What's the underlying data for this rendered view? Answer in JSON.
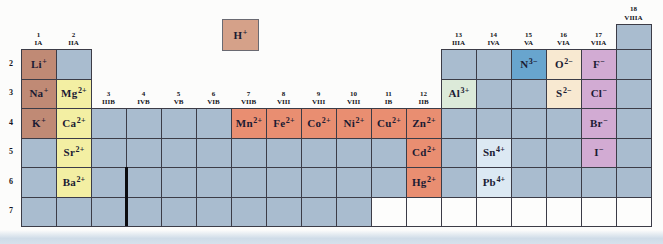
{
  "palette": {
    "grid_line": "#3c3c47",
    "cell_empty": "#a9bccf",
    "cell_white": "#fdfdfc",
    "hydrogen": "#d5a189",
    "alkali": "#c08a75",
    "alkaline_earth": "#f3efa3",
    "transition": "#e98e71",
    "post_transition_green": "#dcead9",
    "post_transition_blue": "#dce9f3",
    "nitride_blue": "#68a5ce",
    "chalcogenide_cream": "#f8e9d1",
    "halide_pink": "#d2abd3",
    "ion_text": "#1b1b33",
    "header_text": "#131320"
  },
  "columns": [
    {
      "number": "1",
      "roman": "IA",
      "first_row": 2
    },
    {
      "number": "2",
      "roman": "IIA",
      "first_row": 2
    },
    {
      "number": "3",
      "roman": "IIIB",
      "first_row": 4
    },
    {
      "number": "4",
      "roman": "IVB",
      "first_row": 4
    },
    {
      "number": "5",
      "roman": "VB",
      "first_row": 4
    },
    {
      "number": "6",
      "roman": "VIB",
      "first_row": 4
    },
    {
      "number": "7",
      "roman": "VIIB",
      "first_row": 4
    },
    {
      "number": "8",
      "roman": "VIII",
      "first_row": 4
    },
    {
      "number": "9",
      "roman": "VIII",
      "first_row": 4
    },
    {
      "number": "10",
      "roman": "VIII",
      "first_row": 4
    },
    {
      "number": "11",
      "roman": "IB",
      "first_row": 4
    },
    {
      "number": "12",
      "roman": "IIB",
      "first_row": 4
    },
    {
      "number": "13",
      "roman": "IIIA",
      "first_row": 2
    },
    {
      "number": "14",
      "roman": "IVA",
      "first_row": 2
    },
    {
      "number": "15",
      "roman": "VA",
      "first_row": 2
    },
    {
      "number": "16",
      "roman": "VIA",
      "first_row": 2
    },
    {
      "number": "17",
      "roman": "VIIA",
      "first_row": 2
    },
    {
      "number": "18",
      "roman": "VIIIA",
      "first_row": 1
    }
  ],
  "period_labels": [
    "2",
    "3",
    "4",
    "5",
    "6",
    "7"
  ],
  "row7_white_start_col": 11,
  "hydrogen_cell": {
    "symbol": "H",
    "charge": "+"
  },
  "ions": [
    {
      "col": 1,
      "row": 2,
      "symbol": "Li",
      "charge": "+",
      "category": "alkali"
    },
    {
      "col": 1,
      "row": 3,
      "symbol": "Na",
      "charge": "+",
      "category": "alkali"
    },
    {
      "col": 1,
      "row": 4,
      "symbol": "K",
      "charge": "+",
      "category": "alkali"
    },
    {
      "col": 2,
      "row": 3,
      "symbol": "Mg",
      "charge": "2+",
      "category": "alkaline_earth"
    },
    {
      "col": 2,
      "row": 4,
      "symbol": "Ca",
      "charge": "2+",
      "category": "alkaline_earth"
    },
    {
      "col": 2,
      "row": 5,
      "symbol": "Sr",
      "charge": "2+",
      "category": "alkaline_earth"
    },
    {
      "col": 2,
      "row": 6,
      "symbol": "Ba",
      "charge": "2+",
      "category": "alkaline_earth"
    },
    {
      "col": 7,
      "row": 4,
      "symbol": "Mn",
      "charge": "2+",
      "category": "transition"
    },
    {
      "col": 8,
      "row": 4,
      "symbol": "Fe",
      "charge": "2+",
      "category": "transition"
    },
    {
      "col": 9,
      "row": 4,
      "symbol": "Co",
      "charge": "2+",
      "category": "transition"
    },
    {
      "col": 10,
      "row": 4,
      "symbol": "Ni",
      "charge": "2+",
      "category": "transition"
    },
    {
      "col": 11,
      "row": 4,
      "symbol": "Cu",
      "charge": "2+",
      "category": "transition"
    },
    {
      "col": 12,
      "row": 4,
      "symbol": "Zn",
      "charge": "2+",
      "category": "transition"
    },
    {
      "col": 12,
      "row": 5,
      "symbol": "Cd",
      "charge": "2+",
      "category": "transition"
    },
    {
      "col": 12,
      "row": 6,
      "symbol": "Hg",
      "charge": "2+",
      "category": "transition"
    },
    {
      "col": 13,
      "row": 3,
      "symbol": "Al",
      "charge": "3+",
      "category": "post_transition_green"
    },
    {
      "col": 14,
      "row": 5,
      "symbol": "Sn",
      "charge": "4+",
      "category": "post_transition_blue"
    },
    {
      "col": 14,
      "row": 6,
      "symbol": "Pb",
      "charge": "4+",
      "category": "post_transition_blue"
    },
    {
      "col": 15,
      "row": 2,
      "symbol": "N",
      "charge": "3−",
      "category": "nitride_blue"
    },
    {
      "col": 16,
      "row": 2,
      "symbol": "O",
      "charge": "2−",
      "category": "chalcogenide_cream"
    },
    {
      "col": 16,
      "row": 3,
      "symbol": "S",
      "charge": "2−",
      "category": "chalcogenide_cream"
    },
    {
      "col": 17,
      "row": 2,
      "symbol": "F",
      "charge": "−",
      "category": "halide_pink"
    },
    {
      "col": 17,
      "row": 3,
      "symbol": "Cl",
      "charge": "−",
      "category": "halide_pink"
    },
    {
      "col": 17,
      "row": 4,
      "symbol": "Br",
      "charge": "−",
      "category": "halide_pink"
    },
    {
      "col": 17,
      "row": 5,
      "symbol": "I",
      "charge": "−",
      "category": "halide_pink"
    }
  ]
}
